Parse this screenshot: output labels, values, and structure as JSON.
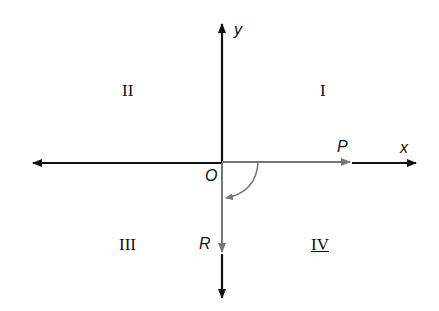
{
  "axes": {
    "x_label": "x",
    "y_label": "y",
    "origin_label": "O"
  },
  "vectors": {
    "p_label": "P",
    "r_label": "R"
  },
  "quadrants": {
    "q1": "I",
    "q2": "II",
    "q3": "III",
    "q4": "IV"
  },
  "colors": {
    "axis": "#111111",
    "vector": "#777777"
  }
}
